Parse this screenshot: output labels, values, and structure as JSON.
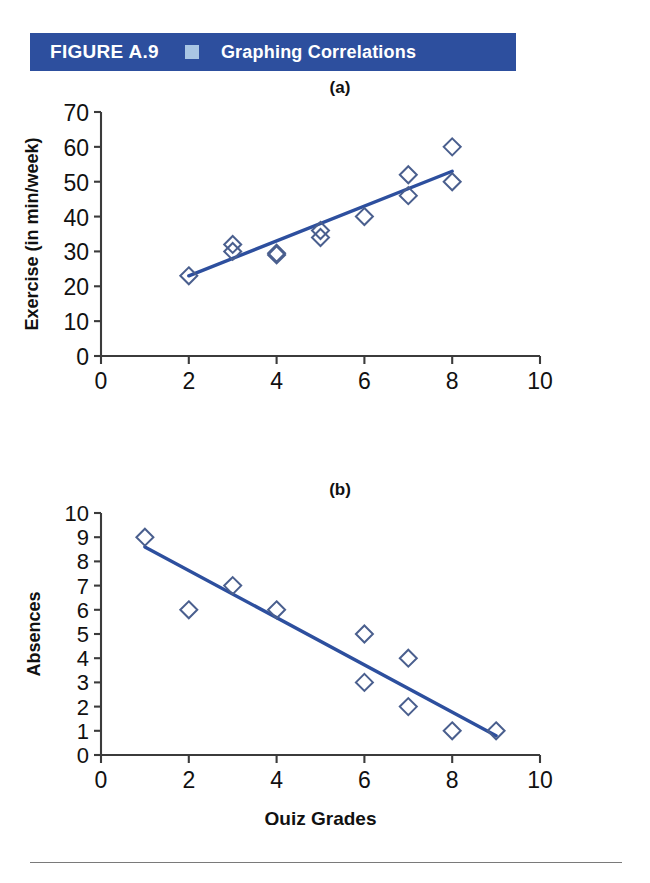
{
  "header": {
    "figure_number": "FIGURE A.9",
    "marker_icon": "square-marker-icon",
    "title": "Graphing Correlations",
    "background_color": "#2d4f9e",
    "marker_color": "#a9c6e4",
    "text_color": "#ffffff"
  },
  "panels": [
    {
      "label": "(a)"
    },
    {
      "label": "(b)"
    }
  ],
  "chart_data": [
    {
      "type": "scatter",
      "panel": "(a)",
      "title": "(a)",
      "xlabel": "Ratings of Body Image Satisfaction",
      "ylabel": "Exercise (in min/week)",
      "xlim": [
        0,
        10
      ],
      "ylim": [
        0,
        70
      ],
      "xticks": [
        0,
        2,
        4,
        6,
        8,
        10
      ],
      "yticks": [
        0,
        10,
        20,
        30,
        40,
        50,
        60,
        70
      ],
      "xtick_labels": [
        "0",
        "2",
        "4",
        "6",
        "8",
        "10"
      ],
      "ytick_labels": [
        "0",
        "10",
        "20",
        "30",
        "40",
        "50",
        "60",
        "70"
      ],
      "grid": false,
      "legend": "none",
      "marker_style": "open-diamond",
      "marker_color": "#4a5f8e",
      "trendline_color": "#2d4f9e",
      "points": [
        {
          "x": 2,
          "y": 23
        },
        {
          "x": 3,
          "y": 32
        },
        {
          "x": 3,
          "y": 30
        },
        {
          "x": 4,
          "y": 29
        },
        {
          "x": 4,
          "y": 29.5
        },
        {
          "x": 5,
          "y": 36
        },
        {
          "x": 5,
          "y": 34
        },
        {
          "x": 6,
          "y": 40
        },
        {
          "x": 7,
          "y": 52
        },
        {
          "x": 7,
          "y": 46
        },
        {
          "x": 8,
          "y": 60
        },
        {
          "x": 8,
          "y": 50
        }
      ],
      "trendline": {
        "x1": 2,
        "y1": 23,
        "x2": 8,
        "y2": 53
      }
    },
    {
      "type": "scatter",
      "panel": "(b)",
      "title": "(b)",
      "xlabel": "Quiz Grades",
      "ylabel": "Absences",
      "xlim": [
        0,
        10
      ],
      "ylim": [
        0,
        10
      ],
      "xticks": [
        0,
        2,
        4,
        6,
        8,
        10
      ],
      "yticks": [
        0,
        1,
        2,
        3,
        4,
        5,
        6,
        7,
        8,
        9,
        10
      ],
      "xtick_labels": [
        "0",
        "2",
        "4",
        "6",
        "8",
        "10"
      ],
      "ytick_labels": [
        "0",
        "1",
        "2",
        "3",
        "4",
        "5",
        "6",
        "7",
        "8",
        "9",
        "10"
      ],
      "grid": false,
      "legend": "none",
      "marker_style": "open-diamond",
      "marker_color": "#4a5f8e",
      "trendline_color": "#2d4f9e",
      "points": [
        {
          "x": 1,
          "y": 9
        },
        {
          "x": 2,
          "y": 6
        },
        {
          "x": 3,
          "y": 7
        },
        {
          "x": 4,
          "y": 6
        },
        {
          "x": 6,
          "y": 5
        },
        {
          "x": 6,
          "y": 3
        },
        {
          "x": 7,
          "y": 4
        },
        {
          "x": 7,
          "y": 2
        },
        {
          "x": 8,
          "y": 1
        },
        {
          "x": 9,
          "y": 1
        }
      ],
      "trendline": {
        "x1": 1,
        "y1": 8.6,
        "x2": 9,
        "y2": 0.8
      }
    }
  ]
}
